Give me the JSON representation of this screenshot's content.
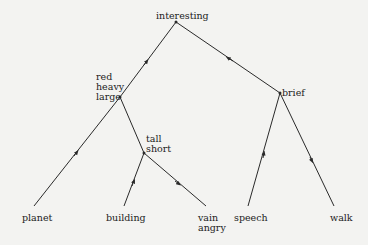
{
  "diagram": {
    "type": "tree",
    "line_color": "#2a2a2a",
    "nodes": {
      "root": {
        "label": "interesting",
        "x": 176,
        "y": 22
      },
      "n1": {
        "label": "red\nheavy\nlarge",
        "x": 120,
        "y": 97
      },
      "n2": {
        "label": "tall\nshort",
        "x": 144,
        "y": 153
      },
      "n3": {
        "label": "brief",
        "x": 280,
        "y": 93
      },
      "leaf_planet": {
        "label": "planet",
        "x": 35,
        "y": 210
      },
      "leaf_building": {
        "label": "building",
        "x": 125,
        "y": 210
      },
      "leaf_vain": {
        "label": "vain\nangry",
        "x": 206,
        "y": 210
      },
      "leaf_speech": {
        "label": "speech",
        "x": 248,
        "y": 210
      },
      "leaf_walk": {
        "label": "walk",
        "x": 337,
        "y": 210
      }
    },
    "edges": [
      {
        "from": "n1",
        "to": "root",
        "arrow": "toward-parent"
      },
      {
        "from": "n3",
        "to": "root",
        "arrow": "toward-parent"
      },
      {
        "from": "n1",
        "to": "leaf_planet",
        "arrow": "toward-parent"
      },
      {
        "from": "n1",
        "to": "n2",
        "arrow": "none"
      },
      {
        "from": "n2",
        "to": "leaf_building",
        "arrow": "toward-parent"
      },
      {
        "from": "n2",
        "to": "leaf_vain",
        "arrow": "toward-parent"
      },
      {
        "from": "n3",
        "to": "leaf_speech",
        "arrow": "toward-parent"
      },
      {
        "from": "n3",
        "to": "leaf_walk",
        "arrow": "toward-parent"
      }
    ]
  },
  "labels": {
    "interesting": "interesting",
    "red_heavy_large": "red\nheavy\nlarge",
    "tall_short": "tall\nshort",
    "brief": "brief",
    "planet": "planet",
    "building": "building",
    "vain_angry": "vain\nangry",
    "speech": "speech",
    "walk": "walk"
  }
}
